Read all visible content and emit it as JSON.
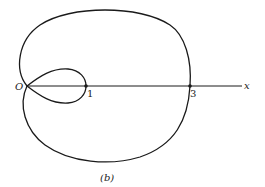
{
  "figure": {
    "caption": "(b)",
    "curve": "limaçon with inner loop",
    "origin_label": "O",
    "axis_label": "x",
    "points": [
      {
        "label": "1",
        "x": 1
      },
      {
        "label": "3",
        "x": 3
      }
    ],
    "stroke_color": "#1a1a1a",
    "background": "#ffffff"
  }
}
